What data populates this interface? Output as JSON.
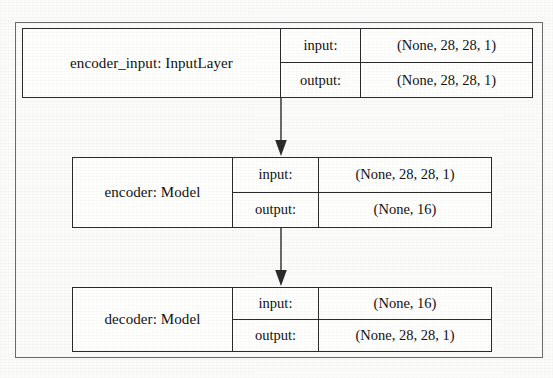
{
  "diagram": {
    "type": "flow-diagram",
    "orientation": "top-to-bottom",
    "frame_color": "#6a6a6a",
    "node_border_color": "#2b2b2b",
    "background_color": "#fbfbfa",
    "io_labels": {
      "input": "input:",
      "output": "output:"
    },
    "nodes": [
      {
        "id": "encoder_input",
        "name": "encoder_input: InputLayer",
        "input_label": "input:",
        "input_shape": "(None, 28, 28, 1)",
        "output_label": "output:",
        "output_shape": "(None, 28, 28, 1)"
      },
      {
        "id": "encoder",
        "name": "encoder: Model",
        "input_label": "input:",
        "input_shape": "(None, 28, 28, 1)",
        "output_label": "output:",
        "output_shape": "(None, 16)"
      },
      {
        "id": "decoder",
        "name": "decoder: Model",
        "input_label": "input:",
        "input_shape": "(None, 16)",
        "output_label": "output:",
        "output_shape": "(None, 28, 28, 1)"
      }
    ],
    "edges": [
      {
        "id": "edge-input-to-encoder",
        "from": "encoder_input",
        "to": "encoder",
        "style": "solid-arrow"
      },
      {
        "id": "edge-encoder-to-decoder",
        "from": "encoder",
        "to": "decoder",
        "style": "solid-arrow"
      }
    ]
  }
}
